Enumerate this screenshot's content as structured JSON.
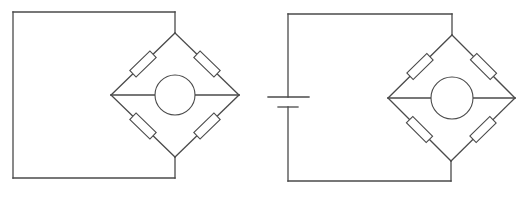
{
  "diagram": {
    "type": "circuit-schematic",
    "colors": {
      "background": "#ffffff",
      "line": "#4a4a4a"
    },
    "circuits": [
      {
        "id": "left",
        "label": "bridge-without-source",
        "frame": {
          "left": 13,
          "top": 12,
          "right": 175,
          "bottom": 178
        },
        "bridge": {
          "top": [
            175,
            33
          ],
          "left": [
            111,
            95
          ],
          "right": [
            239,
            95
          ],
          "bottom": [
            175,
            157
          ],
          "meter": {
            "cx": 175,
            "cy": 95,
            "r": 20
          },
          "resistor_count": 4
        },
        "battery": null
      },
      {
        "id": "right",
        "label": "bridge-with-battery",
        "frame": {
          "left": 288,
          "top": 14,
          "right": 452,
          "bottom": 181
        },
        "bridge": {
          "top": [
            452,
            35
          ],
          "left": [
            388,
            98
          ],
          "right": [
            515,
            98
          ],
          "bottom": [
            451,
            161
          ],
          "meter": {
            "cx": 452,
            "cy": 98,
            "r": 21
          },
          "resistor_count": 4
        },
        "battery": {
          "x": 288,
          "long_plate": {
            "y": 97,
            "x1": 268,
            "x2": 309
          },
          "short_plate": {
            "y": 107,
            "x1": 278,
            "x2": 298
          }
        }
      }
    ]
  }
}
